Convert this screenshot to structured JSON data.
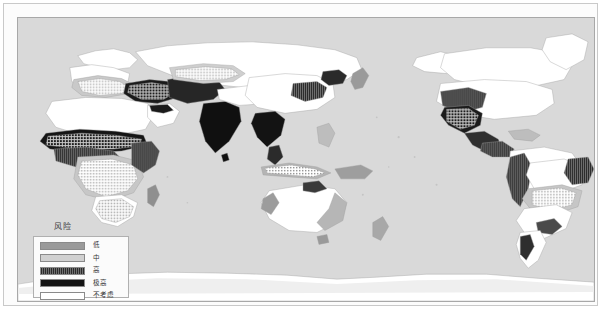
{
  "figure": {
    "kind": "world-choropleth-map",
    "projection": "pacific-centered-world",
    "ocean_color": "#d9d9d9",
    "land_color": "#ffffff",
    "border_color": "#9e9e9e",
    "frame_color": "#a8a8a8",
    "page_border_color": "#c9c9c9"
  },
  "legend": {
    "title": "风险",
    "items": [
      {
        "label": "低",
        "color": "#9a9a9a",
        "pattern": "solid"
      },
      {
        "label": "中",
        "color": "#d0d0d0",
        "pattern": "solid"
      },
      {
        "label": "高",
        "color": "#4a4a4a",
        "pattern": "vertical-hatch"
      },
      {
        "label": "极高",
        "color": "#141414",
        "pattern": "solid"
      },
      {
        "label": "不考虑",
        "color": "#ffffff",
        "pattern": "solid"
      }
    ]
  },
  "map_data": {
    "type": "choropleth",
    "classes": [
      "低",
      "中",
      "高",
      "极高",
      "不考虑"
    ],
    "class_colors": [
      "#9a9a9a",
      "#d0d0d0",
      "#4a4a4a",
      "#141414",
      "#ffffff"
    ],
    "regions": [
      {
        "name": "South Asia (India, Pakistan, Bangladesh)",
        "class": "极高"
      },
      {
        "name": "Middle East / Iran / Iraq",
        "class": "极高"
      },
      {
        "name": "Sahel / West Africa",
        "class": "极高"
      },
      {
        "name": "Horn of Africa",
        "class": "高"
      },
      {
        "name": "Southeast Asia (Indochina)",
        "class": "极高"
      },
      {
        "name": "North China Plain",
        "class": "高"
      },
      {
        "name": "Mexico / Southwest USA",
        "class": "高"
      },
      {
        "name": "Central America",
        "class": "高"
      },
      {
        "name": "Andes / Northwest South America",
        "class": "高"
      },
      {
        "name": "Northeast Brazil",
        "class": "高"
      },
      {
        "name": "Southeast Brazil / La Plata",
        "class": "中"
      },
      {
        "name": "Central Africa",
        "class": "中"
      },
      {
        "name": "Australia coastal margins",
        "class": "中"
      },
      {
        "name": "Central Asia / Kazakhstan",
        "class": "中"
      },
      {
        "name": "Mediterranean Europe",
        "class": "中"
      },
      {
        "name": "Northern Europe",
        "class": "不考虑"
      },
      {
        "name": "Siberia / Russian Far East",
        "class": "不考虑"
      },
      {
        "name": "Canada / Alaska",
        "class": "不考虑"
      },
      {
        "name": "Sahara interior",
        "class": "不考虑"
      },
      {
        "name": "Australia interior",
        "class": "不考虑"
      },
      {
        "name": "Antarctica",
        "class": "不考虑"
      },
      {
        "name": "Greenland",
        "class": "不考虑"
      }
    ]
  }
}
